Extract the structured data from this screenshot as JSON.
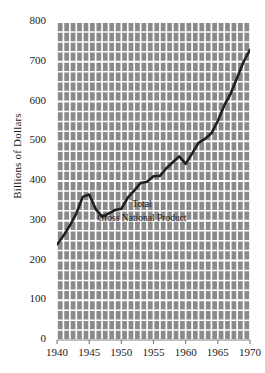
{
  "chart_data": {
    "type": "line",
    "title": "",
    "xlabel": "",
    "ylabel": "Billions of Dollars",
    "xlim": [
      1940,
      1970
    ],
    "ylim": [
      0,
      800
    ],
    "grid": true,
    "legend": "none",
    "yticks": [
      0,
      100,
      200,
      300,
      400,
      500,
      600,
      700,
      800
    ],
    "ytick_labels": [
      "0",
      "100",
      "200",
      "300",
      "400",
      "500",
      "600",
      "700",
      "800"
    ],
    "xticks": [
      1940,
      1945,
      1950,
      1955,
      1960,
      1965,
      1970
    ],
    "xtick_labels": [
      "1940",
      "1945",
      "1950",
      "1955",
      "1960",
      "1965",
      "1970"
    ],
    "y_minor_interval": 25,
    "x_minor_interval": 1,
    "annotations": [
      {
        "name": "series-label-line1",
        "text": "Total",
        "x": 1953.2,
        "y": 337
      },
      {
        "name": "series-label-line2",
        "text": "Gross National Product",
        "x": 1953.2,
        "y": 303
      }
    ],
    "colors": {
      "plot_background": "#8a8a8a",
      "gridline": "#ffffff",
      "line": "#231f20",
      "text": "#1a1a1a",
      "page_background": "#ffffff"
    },
    "series": [
      {
        "name": "Total Gross National Product",
        "x": [
          1940,
          1941,
          1942,
          1943,
          1944,
          1945,
          1946,
          1947,
          1948,
          1949,
          1950,
          1951,
          1952,
          1953,
          1954,
          1955,
          1956,
          1957,
          1958,
          1959,
          1960,
          1961,
          1962,
          1963,
          1964,
          1965,
          1966,
          1967,
          1968,
          1969,
          1970
        ],
        "values": [
          240,
          262,
          288,
          318,
          360,
          366,
          330,
          310,
          318,
          327,
          330,
          358,
          376,
          395,
          398,
          412,
          413,
          432,
          447,
          462,
          443,
          469,
          496,
          506,
          520,
          551,
          590,
          620,
          660,
          700,
          730
        ]
      }
    ]
  }
}
